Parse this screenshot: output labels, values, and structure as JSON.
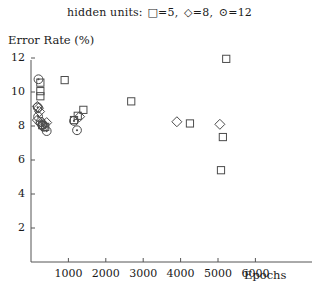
{
  "legend": {
    "prefix": "hidden units:",
    "entries": [
      {
        "glyph": "□",
        "label": "=5",
        "series": "5 hidden units"
      },
      {
        "glyph": "◇",
        "label": "=8",
        "series": "8 hidden units"
      },
      {
        "glyph": "⊙",
        "label": "=12",
        "series": "12 hidden units"
      }
    ]
  },
  "axes": {
    "ytitle": "Error Rate (%)",
    "xtitle": "Epochs",
    "yticks": [
      "12",
      "10",
      "8",
      "6",
      "4",
      "2"
    ],
    "ytick_values": [
      12,
      10,
      8,
      6,
      4,
      2
    ],
    "xticks": [
      "1000",
      "2000",
      "3000",
      "4000",
      "5000",
      "6000"
    ],
    "xtick_values": [
      1000,
      2000,
      3000,
      4000,
      5000,
      6000
    ]
  },
  "chart_data": {
    "type": "scatter",
    "title": "",
    "subtitle": "hidden units: □=5, ◇=8, ⊙=12",
    "xlabel": "Epochs",
    "ylabel": "Error Rate (%)",
    "xlim": [
      0,
      6400
    ],
    "ylim": [
      0,
      12
    ],
    "grid": false,
    "legend_position": "top-center",
    "series": [
      {
        "name": "5 hidden units",
        "marker": "square",
        "points": [
          [
            250,
            10.55
          ],
          [
            250,
            10.05
          ],
          [
            250,
            9.75
          ],
          [
            900,
            10.7
          ],
          [
            300,
            8.05
          ],
          [
            380,
            7.95
          ],
          [
            1150,
            8.35
          ],
          [
            1250,
            8.6
          ],
          [
            1400,
            8.95
          ],
          [
            2680,
            9.45
          ],
          [
            4250,
            8.15
          ],
          [
            5220,
            11.95
          ],
          [
            5130,
            7.35
          ],
          [
            5080,
            5.4
          ]
        ]
      },
      {
        "name": "8 hidden units",
        "marker": "diamond",
        "points": [
          [
            170,
            9.15
          ],
          [
            200,
            9.05
          ],
          [
            230,
            8.85
          ],
          [
            170,
            8.35
          ],
          [
            250,
            8.15
          ],
          [
            330,
            8.1
          ],
          [
            420,
            8.2
          ],
          [
            1300,
            8.55
          ],
          [
            3900,
            8.25
          ],
          [
            5050,
            8.1
          ]
        ]
      },
      {
        "name": "12 hidden units",
        "marker": "circled-dot",
        "points": [
          [
            200,
            10.75
          ],
          [
            180,
            9.1
          ],
          [
            190,
            8.55
          ],
          [
            260,
            8.25
          ],
          [
            300,
            8.05
          ],
          [
            340,
            7.95
          ],
          [
            420,
            7.7
          ],
          [
            1150,
            8.3
          ],
          [
            1230,
            7.75
          ]
        ]
      }
    ]
  }
}
